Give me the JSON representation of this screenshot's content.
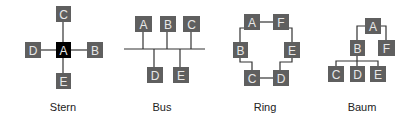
{
  "diagrams": [
    {
      "name": "Stern",
      "type": "star-topology",
      "center": "A",
      "nodes": [
        "A",
        "B",
        "C",
        "D",
        "E"
      ],
      "edges": [
        [
          "A",
          "B"
        ],
        [
          "A",
          "C"
        ],
        [
          "A",
          "D"
        ],
        [
          "A",
          "E"
        ]
      ]
    },
    {
      "name": "Bus",
      "type": "bus-topology",
      "nodes_above": [
        "A",
        "B",
        "C"
      ],
      "nodes_below": [
        "D",
        "E"
      ],
      "edges": [
        [
          "bus",
          "A"
        ],
        [
          "bus",
          "B"
        ],
        [
          "bus",
          "C"
        ],
        [
          "bus",
          "D"
        ],
        [
          "bus",
          "E"
        ]
      ]
    },
    {
      "name": "Ring",
      "type": "ring-topology",
      "nodes": [
        "A",
        "F",
        "E",
        "D",
        "C",
        "B"
      ],
      "edges": [
        [
          "A",
          "F"
        ],
        [
          "F",
          "E"
        ],
        [
          "E",
          "D"
        ],
        [
          "D",
          "C"
        ],
        [
          "C",
          "B"
        ],
        [
          "B",
          "A"
        ]
      ]
    },
    {
      "name": "Baum",
      "type": "tree-topology",
      "root": "A",
      "nodes": [
        "A",
        "B",
        "F",
        "C",
        "D",
        "E"
      ],
      "edges": [
        [
          "A",
          "B"
        ],
        [
          "A",
          "F"
        ],
        [
          "B",
          "C"
        ],
        [
          "B",
          "D"
        ],
        [
          "B",
          "E"
        ]
      ]
    }
  ],
  "labels": {
    "stern": "Stern",
    "bus": "Bus",
    "ring": "Ring",
    "baum": "Baum"
  },
  "node_labels": {
    "A": "A",
    "B": "B",
    "C": "C",
    "D": "D",
    "E": "E",
    "F": "F"
  },
  "colors": {
    "node_fill": "#5f5f5f",
    "center_fill": "#000000",
    "node_text": "#e8e8e8",
    "line": "#333333"
  }
}
